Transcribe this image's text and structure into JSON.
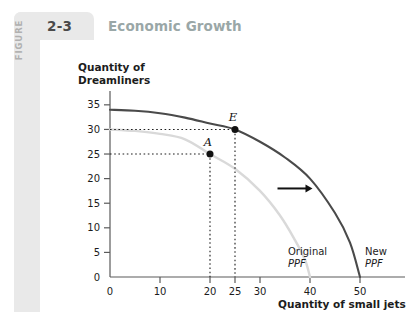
{
  "figure": {
    "kicker": "FIGURE",
    "number": "2-3",
    "title": "Economic Growth"
  },
  "chart_data": {
    "type": "line",
    "title": "Economic Growth",
    "xlabel": "Quantity of small jets",
    "ylabel": "Quantity of Dreamliners",
    "xlim": [
      0,
      55
    ],
    "ylim": [
      0,
      37
    ],
    "grid": false,
    "xticks": [
      0,
      10,
      20,
      25,
      30,
      40,
      50
    ],
    "xtick_labels": [
      "0",
      "10",
      "20",
      "25",
      "30",
      "40",
      "50"
    ],
    "yticks": [
      5,
      10,
      15,
      20,
      25,
      30,
      35
    ],
    "ytick_labels": [
      "5",
      "10",
      "15",
      "20",
      "25",
      "30",
      "35"
    ],
    "series": [
      {
        "name": "Original PPF",
        "label_line1": "Original",
        "label_line2": "PPF",
        "color": "#d9d9d9",
        "x_intercept": 40,
        "y_intercept": 30,
        "points": [
          [
            0,
            30
          ],
          [
            5,
            29.7
          ],
          [
            10,
            29.1
          ],
          [
            15,
            28.0
          ],
          [
            20,
            25.0
          ],
          [
            25,
            22.0
          ],
          [
            30,
            17.5
          ],
          [
            34,
            12.5
          ],
          [
            37,
            7.5
          ],
          [
            39,
            3.5
          ],
          [
            40,
            0
          ]
        ]
      },
      {
        "name": "New PPF",
        "label_line1": "New",
        "label_line2": "PPF",
        "color": "#4a4a4a",
        "x_intercept": 50,
        "y_intercept": 34,
        "points": [
          [
            0,
            34
          ],
          [
            5,
            33.8
          ],
          [
            10,
            33.3
          ],
          [
            15,
            32.4
          ],
          [
            20,
            31.2
          ],
          [
            25,
            30.0
          ],
          [
            30,
            27.5
          ],
          [
            35,
            24.3
          ],
          [
            40,
            20.0
          ],
          [
            45,
            13.0
          ],
          [
            48,
            7.0
          ],
          [
            50,
            0
          ]
        ]
      }
    ],
    "annotations": [
      {
        "label": "A",
        "x": 20,
        "y": 25,
        "on_series": "Original PPF"
      },
      {
        "label": "E",
        "x": 25,
        "y": 30,
        "on_series": "New PPF"
      }
    ],
    "arrow": {
      "from_x": 33.5,
      "to_x": 40.5,
      "y": 18,
      "direction": "right"
    }
  }
}
